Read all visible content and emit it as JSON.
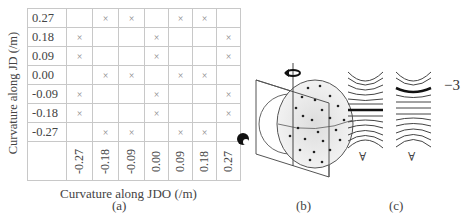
{
  "panel_a": {
    "y_axis_label": "Curvature along JD (/m)",
    "x_axis_label": "Curvature along JDO (/m)",
    "row_labels": [
      "0.27",
      "0.18",
      "0.09",
      "0.00",
      "-0.09",
      "-0.18",
      "-0.27"
    ],
    "col_labels": [
      "-0.27",
      "-0.18",
      "-0.09",
      "0.00",
      "0.09",
      "0.18",
      "0.27"
    ],
    "marks": [
      [
        "",
        "×",
        "×",
        "",
        "×",
        "×",
        ""
      ],
      [
        "×",
        "",
        "",
        "×",
        "",
        "",
        "×"
      ],
      [
        "×",
        "",
        "",
        "×",
        "",
        "",
        "×"
      ],
      [
        "",
        "×",
        "×",
        "",
        "×",
        "×",
        ""
      ],
      [
        "×",
        "",
        "",
        "×",
        "",
        "",
        "×"
      ],
      [
        "×",
        "",
        "",
        "×",
        "",
        "",
        "×"
      ],
      [
        "",
        "×",
        "×",
        "",
        "×",
        "×",
        ""
      ]
    ],
    "caption": "(a)"
  },
  "panel_b": {
    "caption": "(b)",
    "icons": [
      "rotation-arrow-icon",
      "eye-icon"
    ]
  },
  "panel_c": {
    "caption": "(c)",
    "value_label": "−3",
    "marker_glyph": "∀"
  }
}
